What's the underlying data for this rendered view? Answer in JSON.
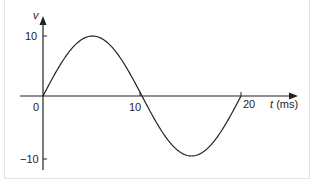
{
  "chart_data": {
    "type": "line",
    "title": "",
    "xlabel": "t (ms)",
    "ylabel": "v",
    "x_axis_var": "t",
    "x_axis_unit": "(ms)",
    "x_ticks": [
      "0",
      "10",
      "20"
    ],
    "y_ticks": [
      "10",
      "−10"
    ],
    "xlim": [
      0,
      20
    ],
    "ylim": [
      -10,
      10
    ],
    "grid": false,
    "legend": null,
    "series": [
      {
        "name": "v(t) = 10 sin(2π t / 20)",
        "x": [
          0,
          2.5,
          5,
          7.5,
          10,
          12.5,
          15,
          17.5,
          20
        ],
        "values": [
          0,
          7.07,
          10,
          7.07,
          0,
          -7.07,
          -10,
          -7.07,
          0
        ]
      }
    ],
    "amplitude": 10,
    "period_ms": 20
  }
}
